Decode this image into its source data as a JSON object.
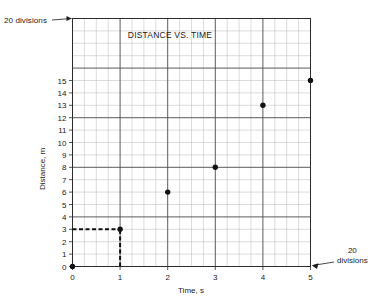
{
  "chart_data": {
    "type": "scatter",
    "title": "DISTANCE VS. TIME",
    "xlabel": "Time, s",
    "ylabel": "Distance, m",
    "xlim": [
      0,
      5
    ],
    "ylim": [
      0,
      20
    ],
    "grid": true,
    "legend": null,
    "x": [
      0,
      1,
      2,
      3,
      4,
      5
    ],
    "values": [
      0,
      3,
      6,
      8,
      13,
      15
    ],
    "points": [
      {
        "x": 0,
        "y": 0
      },
      {
        "x": 1,
        "y": 3
      },
      {
        "x": 2,
        "y": 6
      },
      {
        "x": 3,
        "y": 8
      },
      {
        "x": 4,
        "y": 13
      },
      {
        "x": 5,
        "y": 15
      }
    ],
    "xticks": [
      "0",
      "1",
      "2",
      "3",
      "4",
      "5"
    ],
    "xtick_values": [
      0,
      1,
      2,
      3,
      4,
      5
    ],
    "yticks": [
      "0",
      "1",
      "2",
      "3",
      "4",
      "5",
      "6",
      "7",
      "8",
      "9",
      "10",
      "11",
      "12",
      "13",
      "14",
      "15"
    ],
    "ytick_values": [
      0,
      1,
      2,
      3,
      4,
      5,
      6,
      7,
      8,
      9,
      10,
      11,
      12,
      13,
      14,
      15
    ],
    "guide_lines": [
      {
        "type": "horizontal",
        "y": 3,
        "from_x": 0,
        "to_x": 1,
        "style": "dashed"
      },
      {
        "type": "vertical",
        "x": 1,
        "from_y": 0,
        "to_y": 3,
        "style": "dashed"
      }
    ],
    "x_divisions": 20,
    "y_divisions": 20,
    "annotations": [
      {
        "id": "top-left",
        "text": "20 divisions",
        "points_to": "y-axis top"
      },
      {
        "id": "bottom-right",
        "text": "20\ndivisions",
        "points_to": "x-axis right"
      }
    ],
    "colors": {
      "point": "#111111",
      "grid_minor": "#b9b9b9",
      "grid_major": "#4a4a4a",
      "axis": "#2b2b2b",
      "text": "#1a1a1a",
      "background": "#ffffff"
    }
  },
  "annotations": {
    "top_left": "20 divisions",
    "bottom_right_line1": "20",
    "bottom_right_line2": "divisions"
  }
}
